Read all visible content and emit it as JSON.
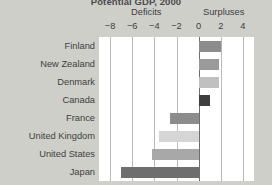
{
  "chart_data": {
    "type": "bar",
    "orientation": "horizontal",
    "title": "Potential GDP, 2000",
    "categories": [
      "Finland",
      "New Zealand",
      "Denmark",
      "Canada",
      "France",
      "United Kingdom",
      "United States",
      "Japan"
    ],
    "values": [
      2.0,
      1.8,
      1.8,
      1.0,
      -2.6,
      -3.6,
      -4.2,
      -7.0
    ],
    "bar_colors": [
      "#8c8c8c",
      "#9a9a9a",
      "#c0c0c0",
      "#3e3e3e",
      "#8c8c8c",
      "#d5d5d5",
      "#a8a8a8",
      "#6e6e6e"
    ],
    "xlabel": "",
    "ylabel": "",
    "xlim": [
      -9,
      5
    ],
    "xticks": [
      -8,
      -6,
      -4,
      -2,
      0,
      2,
      4
    ],
    "xticklabels": [
      "−8",
      "−6",
      "−4",
      "−2",
      "0",
      "2",
      "4"
    ],
    "grid": true,
    "gridlines_at": [
      -8,
      -6,
      -4,
      -2,
      2,
      4
    ],
    "zero_line": 0,
    "legend": "none",
    "annotations": [
      {
        "text": "Deficits",
        "side": "negative"
      },
      {
        "text": "Surpluses",
        "side": "positive"
      }
    ]
  },
  "headers": {
    "deficits": "Deficits",
    "surpluses": "Surpluses"
  },
  "colors": {
    "background": "#cfcfca",
    "plot_background": "#ffffff",
    "gridline": "#b9b9b4",
    "zero_line": "#6e6e6e",
    "text": "#3e3e3e"
  }
}
